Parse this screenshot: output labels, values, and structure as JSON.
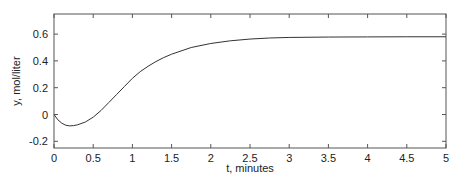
{
  "chart_data": {
    "type": "line",
    "title": "",
    "xlabel": "t, minutes",
    "ylabel": "y, mol/liter",
    "xlim": [
      0,
      5
    ],
    "ylim": [
      -0.25,
      0.75
    ],
    "xticks": [
      0,
      0.5,
      1,
      1.5,
      2,
      2.5,
      3,
      3.5,
      4,
      4.5,
      5
    ],
    "xtick_labels": [
      "0",
      "0.5",
      "1",
      "1.5",
      "2",
      "2.5",
      "3",
      "3.5",
      "4",
      "4.5",
      "5"
    ],
    "yticks": [
      -0.2,
      0,
      0.2,
      0.4,
      0.6
    ],
    "ytick_labels": [
      "-0.2",
      "0",
      "0.2",
      "0.4",
      "0.6"
    ],
    "grid": false,
    "legend": null,
    "series": [
      {
        "name": "y(t)",
        "color": "#333333",
        "x": [
          0,
          0.05,
          0.1,
          0.15,
          0.2,
          0.25,
          0.3,
          0.4,
          0.5,
          0.6,
          0.7,
          0.8,
          0.9,
          1.0,
          1.1,
          1.2,
          1.3,
          1.4,
          1.5,
          1.75,
          2.0,
          2.25,
          2.5,
          2.75,
          3.0,
          3.5,
          4.0,
          4.5,
          5.0
        ],
        "y": [
          0,
          -0.04,
          -0.065,
          -0.08,
          -0.085,
          -0.083,
          -0.077,
          -0.056,
          -0.02,
          0.03,
          0.09,
          0.15,
          0.21,
          0.27,
          0.32,
          0.36,
          0.395,
          0.425,
          0.45,
          0.5,
          0.53,
          0.55,
          0.563,
          0.571,
          0.575,
          0.578,
          0.579,
          0.58,
          0.58
        ]
      }
    ]
  }
}
